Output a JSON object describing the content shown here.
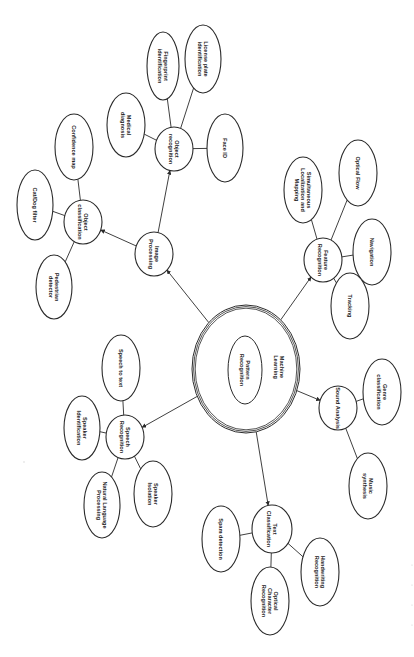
{
  "diagram": {
    "type": "mind-map",
    "orientation": "rotated-90-clockwise",
    "center": {
      "id": "ml",
      "label_outer": "Machine Learning",
      "label_inner": "Pattern Recognition",
      "outer": {
        "cx": 246,
        "cy": 369,
        "rx": 54,
        "ry": 64
      },
      "inner": {
        "cx": 245,
        "cy": 370,
        "rx": 17,
        "ry": 34
      }
    },
    "nodes": [
      {
        "id": "img",
        "label": "Image Processing",
        "cx": 154,
        "cy": 254,
        "rx": 19,
        "ry": 22,
        "level": 1
      },
      {
        "id": "orec",
        "label": "Object recognition",
        "cx": 174,
        "cy": 149,
        "rx": 19,
        "ry": 22,
        "level": 2
      },
      {
        "id": "ocls",
        "label": "Object classification",
        "cx": 83,
        "cy": 222,
        "rx": 19,
        "ry": 22,
        "level": 2
      },
      {
        "id": "med",
        "label": "Medical diagnosis",
        "cx": 126,
        "cy": 125,
        "rx": 19,
        "ry": 32,
        "level": 3
      },
      {
        "id": "fp",
        "label": "Fingerprint identification",
        "cx": 163,
        "cy": 66,
        "rx": 16,
        "ry": 34,
        "level": 3
      },
      {
        "id": "lp",
        "label": "License plate identification",
        "cx": 203,
        "cy": 59,
        "rx": 18,
        "ry": 34,
        "level": 3
      },
      {
        "id": "face",
        "label": "Face ID",
        "cx": 225,
        "cy": 148,
        "rx": 18,
        "ry": 34,
        "level": 3
      },
      {
        "id": "conf",
        "label": "Confidence map",
        "cx": 74,
        "cy": 147,
        "rx": 19,
        "ry": 33,
        "level": 3
      },
      {
        "id": "cat",
        "label": "Cat/Dog filter",
        "cx": 35,
        "cy": 205,
        "rx": 18,
        "ry": 35,
        "level": 3
      },
      {
        "id": "ped",
        "label": "Pedestrian detector",
        "cx": 54,
        "cy": 287,
        "rx": 18,
        "ry": 32,
        "level": 3
      },
      {
        "id": "feat",
        "label": "Feature Recognition",
        "cx": 323,
        "cy": 260,
        "rx": 19,
        "ry": 22,
        "level": 1
      },
      {
        "id": "slam",
        "label": "Simultaneous Localization and Mapping",
        "cx": 303,
        "cy": 190,
        "rx": 19,
        "ry": 33,
        "level": 2
      },
      {
        "id": "flow",
        "label": "Optical Flow",
        "cx": 358,
        "cy": 173,
        "rx": 19,
        "ry": 33,
        "level": 2
      },
      {
        "id": "nav",
        "label": "Navigation",
        "cx": 372,
        "cy": 252,
        "rx": 19,
        "ry": 33,
        "level": 2
      },
      {
        "id": "trk",
        "label": "Tracking",
        "cx": 350,
        "cy": 306,
        "rx": 19,
        "ry": 33,
        "level": 2
      },
      {
        "id": "snd",
        "label": "Sound Analysis",
        "cx": 338,
        "cy": 408,
        "rx": 19,
        "ry": 22,
        "level": 1
      },
      {
        "id": "genre",
        "label": "Genre classification",
        "cx": 382,
        "cy": 392,
        "rx": 19,
        "ry": 33,
        "level": 2
      },
      {
        "id": "music",
        "label": "Music synthesis",
        "cx": 368,
        "cy": 486,
        "rx": 19,
        "ry": 33,
        "level": 2
      },
      {
        "id": "txt",
        "label": "Text Classification",
        "cx": 272,
        "cy": 529,
        "rx": 20,
        "ry": 24,
        "level": 1
      },
      {
        "id": "spam",
        "label": "Spam detection",
        "cx": 221,
        "cy": 539,
        "rx": 19,
        "ry": 33,
        "level": 2
      },
      {
        "id": "ocr",
        "label": "Optical Character Recognition",
        "cx": 270,
        "cy": 601,
        "rx": 19,
        "ry": 34,
        "level": 2
      },
      {
        "id": "hw",
        "label": "Handwriting Recognition",
        "cx": 320,
        "cy": 572,
        "rx": 19,
        "ry": 34,
        "level": 2
      },
      {
        "id": "sp",
        "label": "Speech Recognition",
        "cx": 125,
        "cy": 437,
        "rx": 19,
        "ry": 22,
        "level": 1
      },
      {
        "id": "stt",
        "label": "Speech to text",
        "cx": 121,
        "cy": 368,
        "rx": 19,
        "ry": 33,
        "level": 2
      },
      {
        "id": "sid",
        "label": "Speaker Identification",
        "cx": 82,
        "cy": 428,
        "rx": 18,
        "ry": 32,
        "level": 2
      },
      {
        "id": "nlp",
        "label": "Natural Language Processing",
        "cx": 102,
        "cy": 505,
        "rx": 18,
        "ry": 33,
        "level": 2
      },
      {
        "id": "siso",
        "label": "Speaker Isolation",
        "cx": 153,
        "cy": 494,
        "rx": 19,
        "ry": 33,
        "level": 2
      }
    ],
    "edges": [
      {
        "from": "ml",
        "to": "img",
        "arrow": true
      },
      {
        "from": "ml",
        "to": "feat",
        "arrow": true
      },
      {
        "from": "ml",
        "to": "snd",
        "arrow": true
      },
      {
        "from": "ml",
        "to": "txt",
        "arrow": true
      },
      {
        "from": "ml",
        "to": "sp",
        "arrow": true
      },
      {
        "from": "img",
        "to": "orec",
        "arrow": true
      },
      {
        "from": "img",
        "to": "ocls",
        "arrow": true
      },
      {
        "from": "orec",
        "to": "med",
        "arrow": false
      },
      {
        "from": "orec",
        "to": "fp",
        "arrow": false
      },
      {
        "from": "orec",
        "to": "lp",
        "arrow": false
      },
      {
        "from": "orec",
        "to": "face",
        "arrow": false
      },
      {
        "from": "ocls",
        "to": "conf",
        "arrow": false
      },
      {
        "from": "ocls",
        "to": "cat",
        "arrow": false
      },
      {
        "from": "ocls",
        "to": "ped",
        "arrow": false
      },
      {
        "from": "feat",
        "to": "slam",
        "arrow": false
      },
      {
        "from": "feat",
        "to": "flow",
        "arrow": false
      },
      {
        "from": "feat",
        "to": "nav",
        "arrow": false
      },
      {
        "from": "feat",
        "to": "trk",
        "arrow": false
      },
      {
        "from": "snd",
        "to": "genre",
        "arrow": false
      },
      {
        "from": "snd",
        "to": "music",
        "arrow": false
      },
      {
        "from": "txt",
        "to": "spam",
        "arrow": false
      },
      {
        "from": "txt",
        "to": "ocr",
        "arrow": false
      },
      {
        "from": "txt",
        "to": "hw",
        "arrow": false
      },
      {
        "from": "sp",
        "to": "stt",
        "arrow": false
      },
      {
        "from": "sp",
        "to": "sid",
        "arrow": false
      },
      {
        "from": "sp",
        "to": "nlp",
        "arrow": false
      },
      {
        "from": "sp",
        "to": "siso",
        "arrow": false
      }
    ],
    "colors": {
      "stroke": "#2a2a2a",
      "fill": "#ffffff",
      "text": "#222222",
      "background": "#ffffff"
    }
  }
}
